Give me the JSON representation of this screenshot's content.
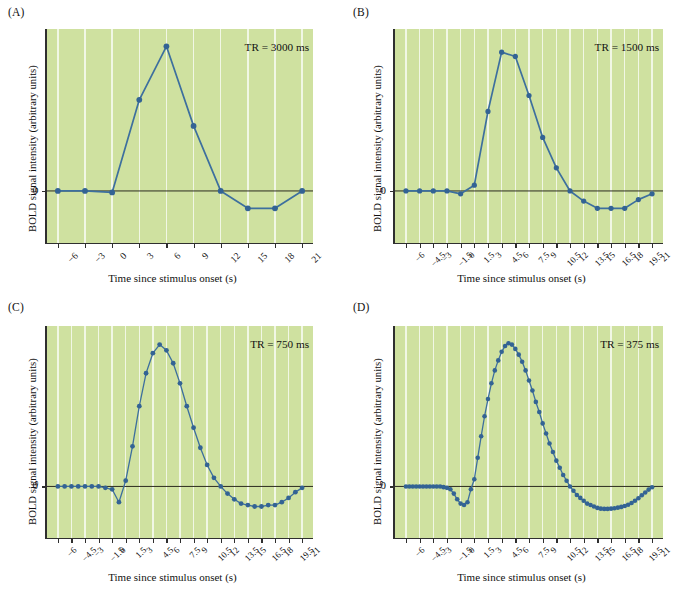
{
  "figure": {
    "xlabel": "Time since stimulus onset (s)",
    "ylabel": "BOLD signal intensity (arbitrary units)",
    "ytick_zero": "0",
    "colors": {
      "plot_background": "#cfe1a0",
      "gridline": "#f4f8ea",
      "curve": "#3d6f9e",
      "marker": "#336394",
      "axis": "#2f2f2f",
      "zero_line": "#2b2b1f"
    }
  },
  "panels": [
    {
      "id": "A",
      "label": "(A)",
      "annotation": "TR = 3000 ms",
      "tr_ms": 3000
    },
    {
      "id": "B",
      "label": "(B)",
      "annotation": "TR = 1500 ms",
      "tr_ms": 1500
    },
    {
      "id": "C",
      "label": "(C)",
      "annotation": "TR = 750 ms",
      "tr_ms": 750
    },
    {
      "id": "D",
      "label": "(D)",
      "annotation": "TR = 375 ms",
      "tr_ms": 375
    }
  ],
  "chart_data": [
    {
      "type": "line",
      "panel": "A",
      "title": "TR = 3000 ms",
      "xlabel": "Time since stimulus onset (s)",
      "ylabel": "BOLD signal intensity (arbitrary units)",
      "xlim": [
        -7.2,
        22.2
      ],
      "ylim": [
        -0.36,
        1.12
      ],
      "grid": true,
      "legend": "none",
      "markers": true,
      "tick_labels": [
        "−6",
        "−3",
        "0",
        "3",
        "6",
        "9",
        "12",
        "15",
        "18",
        "21"
      ],
      "x": [
        -6,
        -3,
        0,
        3,
        6,
        9,
        12,
        15,
        18,
        21
      ],
      "y": [
        0.0,
        0.0,
        -0.01,
        0.63,
        1.0,
        0.45,
        0.0,
        -0.12,
        -0.12,
        0.0
      ]
    },
    {
      "type": "line",
      "panel": "B",
      "title": "TR = 1500 ms",
      "xlabel": "Time since stimulus onset (s)",
      "ylabel": "BOLD signal intensity (arbitrary units)",
      "xlim": [
        -7.2,
        22.2
      ],
      "ylim": [
        -0.36,
        1.12
      ],
      "grid": true,
      "legend": "none",
      "markers": true,
      "tick_labels": [
        "−6",
        "−4.5",
        "−3",
        "−1.5",
        "0",
        "1.5",
        "3",
        "4.5",
        "6",
        "7.5",
        "9",
        "10.5",
        "12",
        "13.5",
        "15",
        "16.5",
        "18",
        "19.5",
        "21"
      ],
      "x": [
        -6,
        -4.5,
        -3,
        -1.5,
        0,
        1.5,
        3,
        4.5,
        6,
        7.5,
        9,
        10.5,
        12,
        13.5,
        15,
        16.5,
        18,
        19.5,
        21
      ],
      "y": [
        0.0,
        0.0,
        0.0,
        0.0,
        -0.02,
        0.04,
        0.55,
        0.96,
        0.93,
        0.66,
        0.37,
        0.16,
        0.0,
        -0.07,
        -0.12,
        -0.12,
        -0.12,
        -0.06,
        -0.02
      ]
    },
    {
      "type": "line",
      "panel": "C",
      "title": "TR = 750 ms",
      "xlabel": "Time since stimulus onset (s)",
      "ylabel": "BOLD signal intensity (arbitrary units)",
      "xlim": [
        -7.2,
        22.2
      ],
      "ylim": [
        -0.36,
        1.12
      ],
      "grid": true,
      "legend": "none",
      "markers": true,
      "tick_labels": [
        "−6",
        "−4.5",
        "−3",
        "−1.5",
        "0",
        "1.5",
        "3",
        "4.5",
        "6",
        "7.5",
        "9",
        "10.5",
        "12",
        "13.5",
        "15",
        "16.5",
        "18",
        "19.5",
        "21"
      ],
      "x": [
        -6,
        -5.25,
        -4.5,
        -3.75,
        -3,
        -2.25,
        -1.5,
        -0.75,
        0,
        0.75,
        1.5,
        2.25,
        3,
        3.75,
        4.5,
        5.25,
        6,
        6.75,
        7.5,
        8.25,
        9,
        9.75,
        10.5,
        11.25,
        12,
        12.75,
        13.5,
        14.25,
        15,
        15.75,
        16.5,
        17.25,
        18,
        18.75,
        19.5,
        20.25,
        21
      ],
      "y": [
        0.0,
        0.0,
        0.0,
        0.0,
        0.0,
        0.0,
        0.0,
        -0.01,
        -0.02,
        -0.11,
        0.04,
        0.28,
        0.56,
        0.79,
        0.93,
        0.99,
        0.95,
        0.86,
        0.72,
        0.56,
        0.41,
        0.27,
        0.15,
        0.06,
        0.0,
        -0.05,
        -0.09,
        -0.12,
        -0.13,
        -0.14,
        -0.14,
        -0.13,
        -0.13,
        -0.11,
        -0.08,
        -0.04,
        -0.01
      ]
    },
    {
      "type": "line",
      "panel": "D",
      "title": "TR = 375 ms",
      "xlabel": "Time since stimulus onset (s)",
      "ylabel": "BOLD signal intensity (arbitrary units)",
      "xlim": [
        -7.2,
        22.2
      ],
      "ylim": [
        -0.36,
        1.12
      ],
      "grid": true,
      "legend": "none",
      "markers": true,
      "tick_labels": [
        "−6",
        "−4.5",
        "−3",
        "−1.5",
        "0",
        "1.5",
        "3",
        "4.5",
        "6",
        "7.5",
        "9",
        "10.5",
        "12",
        "13.5",
        "15",
        "16.5",
        "18",
        "19.5",
        "21"
      ],
      "x": [
        -6,
        -5.625,
        -5.25,
        -4.875,
        -4.5,
        -4.125,
        -3.75,
        -3.375,
        -3,
        -2.625,
        -2.25,
        -1.875,
        -1.5,
        -1.125,
        -0.75,
        -0.375,
        0,
        0.375,
        0.75,
        1.125,
        1.5,
        1.875,
        2.25,
        2.625,
        3,
        3.375,
        3.75,
        4.125,
        4.5,
        4.875,
        5.25,
        5.625,
        6,
        6.375,
        6.75,
        7.125,
        7.5,
        7.875,
        8.25,
        8.625,
        9,
        9.375,
        9.75,
        10.125,
        10.5,
        10.875,
        11.25,
        11.625,
        12,
        12.375,
        12.75,
        13.125,
        13.5,
        13.875,
        14.25,
        14.625,
        15,
        15.375,
        15.75,
        16.125,
        16.5,
        16.875,
        17.25,
        17.625,
        18,
        18.375,
        18.75,
        19.125,
        19.5,
        19.875,
        20.25,
        20.625,
        21
      ],
      "y": [
        0.0,
        0.0,
        0.0,
        0.0,
        0.0,
        0.0,
        0.0,
        0.0,
        0.0,
        0.0,
        0.0,
        -0.005,
        -0.01,
        -0.02,
        -0.05,
        -0.09,
        -0.12,
        -0.13,
        -0.11,
        -0.02,
        0.05,
        0.2,
        0.35,
        0.49,
        0.61,
        0.72,
        0.81,
        0.88,
        0.94,
        0.98,
        1.0,
        0.99,
        0.96,
        0.92,
        0.87,
        0.81,
        0.74,
        0.67,
        0.59,
        0.52,
        0.44,
        0.37,
        0.3,
        0.24,
        0.18,
        0.13,
        0.08,
        0.04,
        0.0,
        -0.03,
        -0.06,
        -0.08,
        -0.1,
        -0.12,
        -0.13,
        -0.14,
        -0.15,
        -0.155,
        -0.157,
        -0.157,
        -0.155,
        -0.152,
        -0.148,
        -0.143,
        -0.137,
        -0.128,
        -0.116,
        -0.1,
        -0.082,
        -0.062,
        -0.042,
        -0.022,
        -0.006
      ]
    }
  ]
}
